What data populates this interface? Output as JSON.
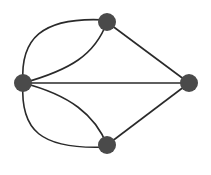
{
  "diagram": {
    "type": "multigraph",
    "node_color": "#4a4a4a",
    "edge_color": "#2a2a2a",
    "nodes": [
      {
        "id": "A",
        "name": "left",
        "x": 23,
        "y": 83
      },
      {
        "id": "B",
        "name": "top",
        "x": 107,
        "y": 22
      },
      {
        "id": "C",
        "name": "right",
        "x": 189,
        "y": 83
      },
      {
        "id": "D",
        "name": "bottom",
        "x": 107,
        "y": 145
      }
    ],
    "edges": [
      {
        "from": "A",
        "to": "B",
        "style": "outer-curve"
      },
      {
        "from": "A",
        "to": "B",
        "style": "inner-curve"
      },
      {
        "from": "A",
        "to": "D",
        "style": "outer-curve"
      },
      {
        "from": "A",
        "to": "D",
        "style": "inner-curve"
      },
      {
        "from": "A",
        "to": "C",
        "style": "straight"
      },
      {
        "from": "B",
        "to": "C",
        "style": "straight"
      },
      {
        "from": "D",
        "to": "C",
        "style": "straight"
      }
    ]
  }
}
